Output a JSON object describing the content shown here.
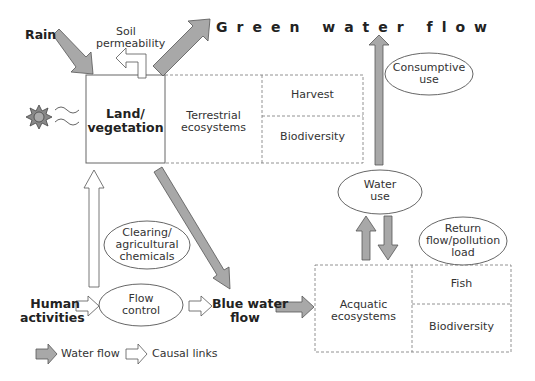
{
  "diagram": {
    "title": "Green water flow",
    "nodes": {
      "rain": "Rain",
      "soil_permeability": [
        "Soil",
        "permeability"
      ],
      "land_vegetation": [
        "Land/",
        "vegetation"
      ],
      "terrestrial_ecosystems": [
        "Terrestrial",
        "ecosystems"
      ],
      "harvest": "Harvest",
      "biodiversity_terrestrial": "Biodiversity",
      "consumptive_use": [
        "Consumptive",
        "use"
      ],
      "water_use": [
        "Water",
        "use"
      ],
      "return_flow": [
        "Return",
        "flow/pollution",
        "load"
      ],
      "clearing": [
        "Clearing/",
        "agricultural",
        "chemicals"
      ],
      "human_activities": [
        "Human",
        "activities"
      ],
      "flow_control": [
        "Flow",
        "control"
      ],
      "blue_water_flow": [
        "Blue water",
        "flow"
      ],
      "acquatic_ecosystems": [
        "Acquatic",
        "ecosystems"
      ],
      "fish": "Fish",
      "biodiversity_aquatic": "Biodiversity"
    },
    "legend": {
      "water_flow": "Water flow",
      "causal_links": "Causal links"
    },
    "icons": {
      "sun": "sun-icon",
      "radiation": "wave-lines"
    },
    "colors": {
      "water_arrow_fill": "#a8a8a8",
      "stroke": "#555555",
      "dashed_border": "#777777"
    }
  }
}
